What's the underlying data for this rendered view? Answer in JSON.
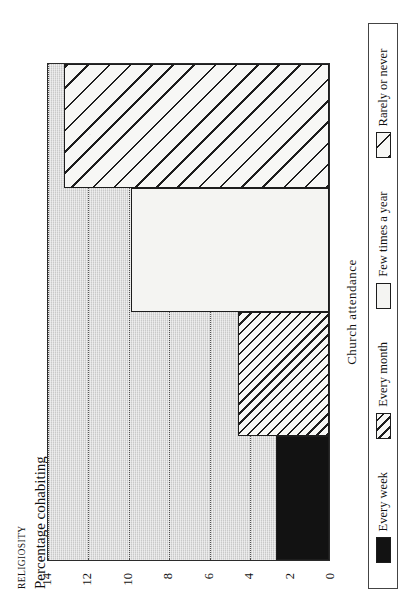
{
  "figure": {
    "kicker": "RELIGIOSITY",
    "subtitle": "Percentage cohabiting",
    "rotation_note": "90"
  },
  "axis": {
    "x_caption": "Church attendance",
    "y_ticks": [
      "14",
      "12",
      "10",
      "8",
      "6",
      "4",
      "2",
      "0"
    ]
  },
  "legend": {
    "items": [
      {
        "label": "Every week",
        "pattern": "solid-black"
      },
      {
        "label": "Every month",
        "pattern": "hatch-fine"
      },
      {
        "label": "Few times a year",
        "pattern": "blank-white"
      },
      {
        "label": "Rarely or never",
        "pattern": "hatch-wide"
      }
    ]
  },
  "chart_data": {
    "type": "bar",
    "title": "Percentage cohabiting",
    "subtitle": "RELIGIOSITY",
    "xlabel": "Church attendance",
    "ylabel": "Percentage cohabiting",
    "categories": [
      "Every week",
      "Every month",
      "Few times a year",
      "Rarely or never"
    ],
    "values": [
      2.6,
      4.5,
      9.8,
      13.1
    ],
    "ylim": [
      0,
      14
    ],
    "ytick_values": [
      0,
      2,
      4,
      6,
      8,
      10,
      12,
      14
    ],
    "grid": "horizontal-dotted",
    "legend_position": "bottom",
    "orientation": "vertical-bars-rendered-rotated-90ccw",
    "series": [
      {
        "name": "Percentage cohabiting",
        "values": [
          2.6,
          4.5,
          9.8,
          13.1
        ],
        "patterns": [
          "solid-black",
          "hatch-fine",
          "blank-white",
          "hatch-wide"
        ]
      }
    ]
  },
  "colors": {
    "plot_background": "#c9c9c9",
    "bar_solid": "#121212",
    "bar_blank": "#f4f4f2",
    "ink": "#1d1d1d",
    "page": "#ffffff"
  }
}
